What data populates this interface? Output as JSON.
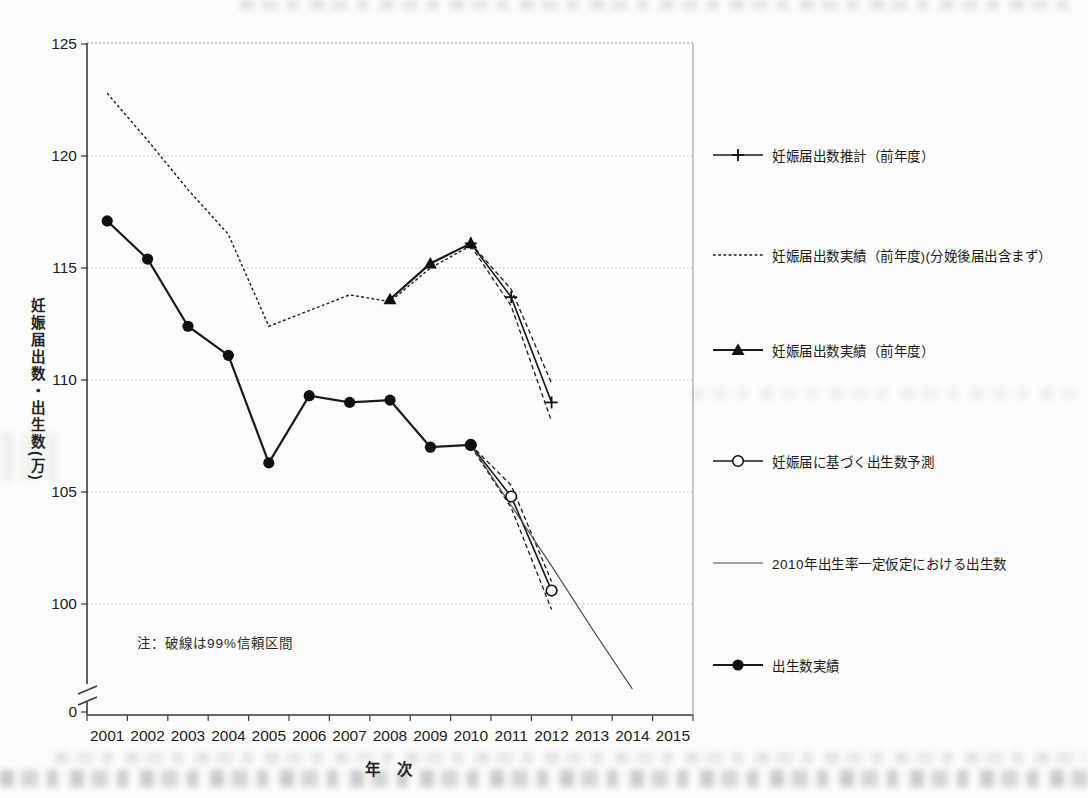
{
  "page": {
    "kind": "scanned-document-figure",
    "background_color": "#fcfcfa",
    "line_color": "#1a1a1a",
    "grid_color": "#b5b5b5"
  },
  "chart_data": {
    "type": "line",
    "title": "",
    "xlabel": "年 次",
    "ylabel": "妊娠届出数・出生数(万)",
    "note": "注：破線は99%信頼区間",
    "x_ticks": [
      2001,
      2002,
      2003,
      2004,
      2005,
      2006,
      2007,
      2008,
      2009,
      2010,
      2011,
      2012,
      2013,
      2014,
      2015
    ],
    "y_ticks": [
      125,
      120,
      115,
      110,
      105,
      100,
      0
    ],
    "y_gridlines": [
      120,
      115,
      110,
      105,
      100
    ],
    "ylim_display": [
      100,
      125
    ],
    "axis_break_above_zero": true,
    "grid": "horizontal-dotted",
    "legend_position": "right",
    "series": [
      {
        "id": "pregnancy-notifications-estimate",
        "name": "妊娠届出数推計（前年度）",
        "marker": "plus",
        "line": "medium",
        "x": [
          2010,
          2011,
          2012
        ],
        "y": [
          116.1,
          113.7,
          109.0
        ]
      },
      {
        "id": "pregnancy-notifications-actual-excl-postpartum",
        "name": "妊娠届出数実績（前年度)(分娩後届出含まず）",
        "marker": "none",
        "line": "dotted",
        "x": [
          2001,
          2002,
          2003,
          2004,
          2005,
          2006,
          2007,
          2008,
          2009,
          2010
        ],
        "y": [
          122.8,
          120.7,
          118.5,
          116.5,
          112.4,
          113.1,
          113.8,
          113.5,
          115.0,
          116.0
        ]
      },
      {
        "id": "pregnancy-notifications-actual",
        "name": "妊娠届出数実績（前年度）",
        "marker": "triangle-filled",
        "line": "bold",
        "x": [
          2008,
          2009,
          2010
        ],
        "y": [
          113.6,
          115.2,
          116.1
        ]
      },
      {
        "id": "births-forecast-from-notifications",
        "name": "妊娠届に基づく出生数予測",
        "marker": "circle-open",
        "line": "medium",
        "x": [
          2010,
          2011,
          2012
        ],
        "y": [
          107.1,
          104.8,
          100.6
        ]
      },
      {
        "id": "births-constant-2010-fertility",
        "name": "2010年出生率一定仮定における出生数",
        "marker": "none",
        "line": "thin",
        "x": [
          2010,
          2011,
          2012,
          2013,
          2014
        ],
        "y": [
          107.1,
          104.4,
          101.7,
          98.9,
          96.2
        ]
      },
      {
        "id": "births-actual",
        "name": "出生数実績",
        "marker": "circle-filled",
        "line": "bold",
        "x": [
          2001,
          2002,
          2003,
          2004,
          2005,
          2006,
          2007,
          2008,
          2009,
          2010
        ],
        "y": [
          117.1,
          115.4,
          112.4,
          111.1,
          106.3,
          109.3,
          109.0,
          109.1,
          107.0,
          107.1
        ]
      }
    ],
    "confidence_bands": [
      {
        "for": "pregnancy-notifications-estimate",
        "level": "99%",
        "upper": {
          "x": [
            2010,
            2011,
            2012
          ],
          "y": [
            116.1,
            114.05,
            109.85
          ]
        },
        "lower": {
          "x": [
            2010,
            2011,
            2012
          ],
          "y": [
            116.0,
            113.3,
            108.15
          ]
        }
      },
      {
        "for": "births-forecast-from-notifications",
        "level": "99%",
        "upper": {
          "x": [
            2010,
            2011,
            2012
          ],
          "y": [
            107.1,
            105.3,
            101.0
          ]
        },
        "lower": {
          "x": [
            2010,
            2011,
            2012
          ],
          "y": [
            107.05,
            104.3,
            99.75
          ]
        }
      }
    ],
    "legend": [
      {
        "swatch": "plus-line",
        "label": "妊娠届出数推計（前年度）"
      },
      {
        "swatch": "dotted-line",
        "label": "妊娠届出数実績（前年度)(分娩後届出含まず）"
      },
      {
        "swatch": "triangle-line",
        "label": "妊娠届出数実績（前年度）"
      },
      {
        "swatch": "open-circle-line",
        "label": "妊娠届に基づく出生数予測"
      },
      {
        "swatch": "thin-line",
        "label": "2010年出生率一定仮定における出生数"
      },
      {
        "swatch": "filled-circle-line",
        "label": "出生数実績"
      }
    ],
    "y_axis_bottom_label": "0"
  }
}
